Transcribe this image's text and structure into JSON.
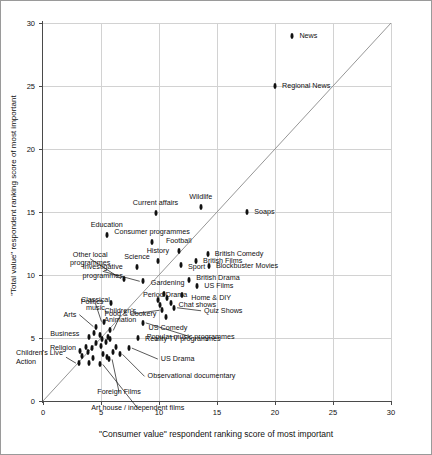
{
  "chart_data": {
    "type": "scatter",
    "title": "",
    "xlabel": "\"Consumer value\" respondent ranking score of most important",
    "ylabel": "\"Total value\" respondent ranking score of most important",
    "xlim": [
      0,
      30
    ],
    "ylim": [
      0,
      30
    ],
    "xticks": [
      0,
      5,
      10,
      15,
      20,
      25,
      30
    ],
    "yticks": [
      0,
      5,
      10,
      15,
      20,
      25,
      30
    ],
    "grid": true,
    "legend": "none",
    "annotations": [
      "diagonal y = x reference line"
    ],
    "points": [
      {
        "label": "News",
        "x": 21.5,
        "y": 29.0
      },
      {
        "label": "Regional News",
        "x": 20.0,
        "y": 25.0
      },
      {
        "label": "Soaps",
        "x": 17.6,
        "y": 15.0
      },
      {
        "label": "Wildlife",
        "x": 13.6,
        "y": 15.4
      },
      {
        "label": "Current affairs",
        "x": 9.7,
        "y": 14.9
      },
      {
        "label": "Education",
        "x": 5.5,
        "y": 13.2
      },
      {
        "label": "Consumer programmes",
        "x": 9.4,
        "y": 12.6
      },
      {
        "label": "Football",
        "x": 11.7,
        "y": 11.9
      },
      {
        "label": "British Comedy",
        "x": 14.2,
        "y": 11.7
      },
      {
        "label": "British Films",
        "x": 13.2,
        "y": 11.1
      },
      {
        "label": "Blockbuster Movies",
        "x": 14.3,
        "y": 10.7
      },
      {
        "label": "Sport",
        "x": 11.9,
        "y": 10.8
      },
      {
        "label": "History",
        "x": 9.9,
        "y": 11.1
      },
      {
        "label": "Science",
        "x": 8.1,
        "y": 10.6
      },
      {
        "label": "Other local programmes",
        "x": 7.0,
        "y": 9.7
      },
      {
        "label": "British Drama",
        "x": 12.6,
        "y": 9.6
      },
      {
        "label": "US Films",
        "x": 13.3,
        "y": 9.1
      },
      {
        "label": "Investigative programmes",
        "x": 8.6,
        "y": 9.5
      },
      {
        "label": "Gardening",
        "x": 10.4,
        "y": 8.5
      },
      {
        "label": "Period Drama",
        "x": 10.7,
        "y": 8.2
      },
      {
        "label": "Home & DIY",
        "x": 12.0,
        "y": 8.4
      },
      {
        "label": "Chat shows",
        "x": 11.0,
        "y": 7.8
      },
      {
        "label": "Quiz Shows",
        "x": 11.3,
        "y": 7.4
      },
      {
        "label": "Food & Cookery",
        "x": 10.3,
        "y": 7.2
      },
      {
        "label": "US Comedy",
        "x": 10.6,
        "y": 6.7
      },
      {
        "label": "Popular music programmes",
        "x": 8.6,
        "y": 6.2
      },
      {
        "label": "Politics",
        "x": 5.9,
        "y": 7.8
      },
      {
        "label": "Classical music",
        "x": 5.3,
        "y": 6.3
      },
      {
        "label": "Children's Animation",
        "x": 5.8,
        "y": 5.6
      },
      {
        "label": "Arts",
        "x": 4.6,
        "y": 5.9
      },
      {
        "label": "Business",
        "x": 4.0,
        "y": 5.1
      },
      {
        "label": "Religion",
        "x": 3.7,
        "y": 4.3
      },
      {
        "label": "Reality TV programmes",
        "x": 8.2,
        "y": 5.0
      },
      {
        "label": "US Drama",
        "x": 7.4,
        "y": 4.2
      },
      {
        "label": "Observational documentary",
        "x": 6.6,
        "y": 3.7
      },
      {
        "label": "Foreign Films",
        "x": 5.7,
        "y": 3.3
      },
      {
        "label": "Art house / independent films",
        "x": 4.9,
        "y": 2.9
      },
      {
        "label": "Children's Live Action",
        "x": 3.1,
        "y": 3.0
      }
    ],
    "extra_markers": [
      {
        "x": 4.4,
        "y": 5.4
      },
      {
        "x": 4.9,
        "y": 5.2
      },
      {
        "x": 5.1,
        "y": 4.9
      },
      {
        "x": 5.4,
        "y": 4.7
      },
      {
        "x": 5.6,
        "y": 5.1
      },
      {
        "x": 5.0,
        "y": 4.4
      },
      {
        "x": 4.6,
        "y": 4.6
      },
      {
        "x": 4.2,
        "y": 4.2
      },
      {
        "x": 3.9,
        "y": 3.9
      },
      {
        "x": 5.2,
        "y": 3.7
      },
      {
        "x": 5.5,
        "y": 3.5
      },
      {
        "x": 6.0,
        "y": 3.9
      },
      {
        "x": 6.3,
        "y": 4.3
      },
      {
        "x": 4.3,
        "y": 3.4
      },
      {
        "x": 4.0,
        "y": 3.0
      },
      {
        "x": 3.4,
        "y": 3.6
      },
      {
        "x": 3.2,
        "y": 4.0
      },
      {
        "x": 5.8,
        "y": 4.9
      },
      {
        "x": 9.9,
        "y": 8.0
      },
      {
        "x": 10.1,
        "y": 7.6
      }
    ]
  },
  "labels": {
    "x_ticks": [
      "0",
      "5",
      "10",
      "15",
      "20",
      "25",
      "30"
    ],
    "y_ticks": [
      "0",
      "5",
      "10",
      "15",
      "20",
      "25",
      "30"
    ]
  }
}
